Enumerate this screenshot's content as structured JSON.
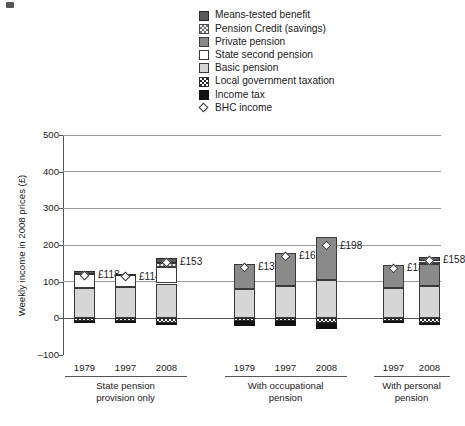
{
  "chart_data": {
    "type": "bar",
    "title": "",
    "xlabel": "",
    "ylabel": "Weekly income in 2008 prices (£)",
    "ylim": [
      -100,
      500
    ],
    "yticks": [
      "500",
      "400",
      "300",
      "200",
      "100",
      "0",
      "–100"
    ],
    "ytick_values": [
      500,
      400,
      300,
      200,
      100,
      0,
      -100
    ],
    "grid": true,
    "legend_position": "top-center",
    "stacked": true,
    "series": [
      {
        "name": "Means-tested benefit",
        "key": "means",
        "color": "#595959",
        "values": [
          6,
          4,
          14,
          0,
          0,
          0,
          0,
          13
        ]
      },
      {
        "name": "Pension Credit (savings)",
        "key": "pcred",
        "color": "#f2f2f2",
        "values": [
          0,
          0,
          10,
          0,
          0,
          0,
          0,
          7
        ]
      },
      {
        "name": "Private pension",
        "key": "priv",
        "color": "#8a8a8a",
        "values": [
          0,
          0,
          0,
          68,
          89,
          118,
          62,
          60
        ]
      },
      {
        "name": "State second pension",
        "key": "sps",
        "color": "#ffffff",
        "values": [
          38,
          33,
          46,
          0,
          0,
          0,
          0,
          0
        ]
      },
      {
        "name": "Basic pension",
        "key": "basic",
        "color": "#d6d6d6",
        "values": [
          84,
          85,
          95,
          79,
          88,
          104,
          84,
          88
        ]
      },
      {
        "name": "Local government taxation",
        "key": "lgt",
        "color": "#ffffff",
        "values": [
          -6,
          -6,
          -13,
          -7,
          -7,
          -14,
          -7,
          -14
        ]
      },
      {
        "name": "Income tax",
        "key": "itax",
        "color": "#121212",
        "values": [
          -4,
          -2,
          -2,
          -13,
          -14,
          -16,
          -3,
          -3
        ]
      }
    ],
    "marker_series": {
      "name": "BHC income",
      "marker": "diamond",
      "values": [
        118,
        114,
        153,
        139,
        169,
        198,
        136,
        158
      ],
      "labels": [
        "£118",
        "£114",
        "£153",
        "£139",
        "£169",
        "£198",
        "£136",
        "£158"
      ]
    },
    "categories": [
      "1979",
      "1997",
      "2008",
      "1979",
      "1997",
      "2008",
      "1997",
      "2008"
    ],
    "groups": [
      {
        "label": "State pension\nprovision only",
        "line1": "State pension",
        "line2": "provision only",
        "years": [
          "1979",
          "1997",
          "2008"
        ]
      },
      {
        "label": "With occupational\npension",
        "line1": "With occupational",
        "line2": "pension",
        "years": [
          "1979",
          "1997",
          "2008"
        ]
      },
      {
        "label": "With personal\npension",
        "line1": "With personal",
        "line2": "pension",
        "years": [
          "1997",
          "2008"
        ]
      }
    ]
  },
  "legend": {
    "items": [
      {
        "label": "Means-tested benefit",
        "swatch": "means-swatch"
      },
      {
        "label": "Pension Credit (savings)",
        "swatch": "pension-credit-swatch"
      },
      {
        "label": "Private pension",
        "swatch": "private-pension-swatch"
      },
      {
        "label": "State second pension",
        "swatch": "state-second-pension-swatch"
      },
      {
        "label": "Basic pension",
        "swatch": "basic-pension-swatch"
      },
      {
        "label": "Local government taxation",
        "swatch": "local-government-taxation-swatch"
      },
      {
        "label": "Income tax",
        "swatch": "income-tax-swatch"
      },
      {
        "label": "BHC income",
        "swatch": "bhc-income-diamond-marker"
      }
    ]
  }
}
